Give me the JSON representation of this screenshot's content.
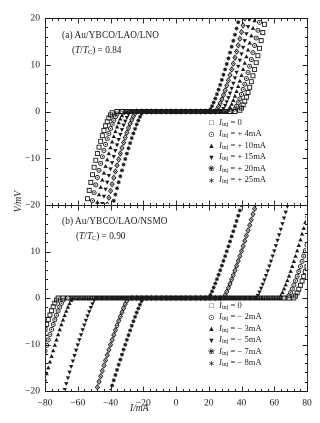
{
  "figure": {
    "axis": {
      "xlabel": "I/mA",
      "ylabel": "V/mV"
    },
    "panel_a": {
      "title": "(a) Au/YBCO/LAO/LNO",
      "subtitle": "(T/TC) = 0.84",
      "sub_ratio": "0.84"
    },
    "panel_b": {
      "title": "(b) Au/YBCO/LAO/NSMO",
      "subtitle": "(T/TC) = 0.90",
      "sub_ratio": "0.90"
    }
  },
  "chart_data": [
    {
      "type": "scatter",
      "panel": "a",
      "title": "(a) Au/YBCO/LAO/LNO",
      "annotation": "(T/TC) = 0.84",
      "xlabel": "I/mA",
      "ylabel": "V/mV",
      "xlim": [
        -80,
        80
      ],
      "ylim": [
        -20,
        20
      ],
      "xticks": [
        -80,
        -60,
        -40,
        -20,
        0,
        20,
        40,
        60,
        80
      ],
      "yticks": [
        -20,
        -10,
        0,
        10,
        20
      ],
      "minor_ticks_per_interval": 4,
      "grid": false,
      "legend_position": "right-lower",
      "series": [
        {
          "name": "Iinj = 0",
          "label_value": "0",
          "marker": "square",
          "ic_pos": 38.0,
          "ic_neg": -38.0,
          "sharpness": 1.55
        },
        {
          "name": "Iinj = +4mA",
          "label_value": "+ 4mA",
          "marker": "circle",
          "ic_pos": 34.5,
          "ic_neg": -34.5,
          "sharpness": 1.5
        },
        {
          "name": "Iinj = +10mA",
          "label_value": "+ 10mA",
          "marker": "triangle-up",
          "ic_pos": 31.0,
          "ic_neg": -31.0,
          "sharpness": 1.45
        },
        {
          "name": "Iinj = +15mA",
          "label_value": "+ 15mA",
          "marker": "triangle-down",
          "ic_pos": 27.5,
          "ic_neg": -27.5,
          "sharpness": 1.4
        },
        {
          "name": "Iinj = +20mA",
          "label_value": "+ 20mA",
          "marker": "diamond",
          "ic_pos": 24.0,
          "ic_neg": -24.0,
          "sharpness": 1.35
        },
        {
          "name": "Iinj = +25mA",
          "label_value": "+ 25mA",
          "marker": "plus",
          "ic_pos": 20.0,
          "ic_neg": -20.0,
          "sharpness": 1.28
        }
      ]
    },
    {
      "type": "scatter",
      "panel": "b",
      "title": "(b) Au/YBCO/LAO/NSMO",
      "annotation": "(T/TC) = 0.90",
      "xlabel": "I/mA",
      "ylabel": "V/mV",
      "xlim": [
        -80,
        80
      ],
      "ylim": [
        -20,
        20
      ],
      "xticks": [
        -80,
        -60,
        -40,
        -20,
        0,
        20,
        40,
        60,
        80
      ],
      "yticks": [
        -20,
        -10,
        0,
        10,
        20
      ],
      "minor_ticks_per_interval": 4,
      "grid": false,
      "legend_position": "right-lower",
      "series": [
        {
          "name": "Iinj = 0",
          "label_value": "0",
          "marker": "square",
          "ic_pos": 72.0,
          "ic_neg": -72.0,
          "sharpness": 1.3
        },
        {
          "name": "Iinj = -2mA",
          "label_value": "− 2mA",
          "marker": "circle",
          "ic_pos": 68.0,
          "ic_neg": -68.0,
          "sharpness": 1.28
        },
        {
          "name": "Iinj = -3mA",
          "label_value": "− 3mA",
          "marker": "triangle-up",
          "ic_pos": 63.0,
          "ic_neg": -63.0,
          "sharpness": 1.26
        },
        {
          "name": "Iinj = -5mA",
          "label_value": "− 5mA",
          "marker": "triangle-down",
          "ic_pos": 49.0,
          "ic_neg": -49.0,
          "sharpness": 1.22
        },
        {
          "name": "Iinj = -7mA",
          "label_value": "− 7mA",
          "marker": "diamond",
          "ic_pos": 29.0,
          "ic_neg": -29.0,
          "sharpness": 1.18
        },
        {
          "name": "Iinj = -8mA",
          "label_value": "− 8mA",
          "marker": "plus",
          "ic_pos": 20.0,
          "ic_neg": -20.0,
          "sharpness": 1.15
        }
      ]
    }
  ],
  "legend_a": {
    "symbol_label": "I",
    "sub": "inj",
    "rows": [
      {
        "marker_glyph": "□",
        "marker": "square",
        "text": "= 0"
      },
      {
        "marker_glyph": "⊙",
        "marker": "circle",
        "text": "= + 4mA"
      },
      {
        "marker_glyph": "▲",
        "marker": "triangle-up",
        "text": "= + 10mA"
      },
      {
        "marker_glyph": "▼",
        "marker": "triangle-down",
        "text": "= + 15mA"
      },
      {
        "marker_glyph": "❀",
        "marker": "diamond",
        "text": "= + 20mA"
      },
      {
        "marker_glyph": "∗",
        "marker": "plus",
        "text": "= + 25mA"
      }
    ]
  },
  "legend_b": {
    "symbol_label": "I",
    "sub": "inj",
    "rows": [
      {
        "marker_glyph": "□",
        "marker": "square",
        "text": "= 0"
      },
      {
        "marker_glyph": "⊙",
        "marker": "circle",
        "text": "= − 2mA"
      },
      {
        "marker_glyph": "▲",
        "marker": "triangle-up",
        "text": "= − 3mA"
      },
      {
        "marker_glyph": "▼",
        "marker": "triangle-down",
        "text": "= − 5mA"
      },
      {
        "marker_glyph": "❀",
        "marker": "diamond",
        "text": "= − 7mA"
      },
      {
        "marker_glyph": "∗",
        "marker": "plus",
        "text": "= − 8mA"
      }
    ]
  }
}
